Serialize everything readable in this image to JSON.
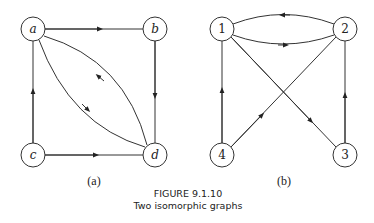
{
  "graph_a": {
    "label": "(a)",
    "nodes": [
      {
        "id": "a",
        "label": "a"
      },
      {
        "id": "b",
        "label": "b"
      },
      {
        "id": "c",
        "label": "c"
      },
      {
        "id": "d",
        "label": "d"
      }
    ],
    "edges": [
      {
        "from": "a",
        "to": "b"
      },
      {
        "from": "b",
        "to": "d"
      },
      {
        "from": "c",
        "to": "a"
      },
      {
        "from": "c",
        "to": "d"
      },
      {
        "from": "a",
        "to": "d"
      },
      {
        "from": "d",
        "to": "a"
      }
    ]
  },
  "graph_b": {
    "label": "(b)",
    "nodes": [
      {
        "id": "1",
        "label": "1"
      },
      {
        "id": "2",
        "label": "2"
      },
      {
        "id": "3",
        "label": "3"
      },
      {
        "id": "4",
        "label": "4"
      }
    ],
    "edges": [
      {
        "from": "2",
        "to": "1"
      },
      {
        "from": "1",
        "to": "2"
      },
      {
        "from": "4",
        "to": "1"
      },
      {
        "from": "4",
        "to": "2"
      },
      {
        "from": "1",
        "to": "3"
      },
      {
        "from": "3",
        "to": "2"
      }
    ]
  },
  "caption": {
    "figure": "FIGURE 9.1.10",
    "title": "Two isomorphic graphs"
  }
}
